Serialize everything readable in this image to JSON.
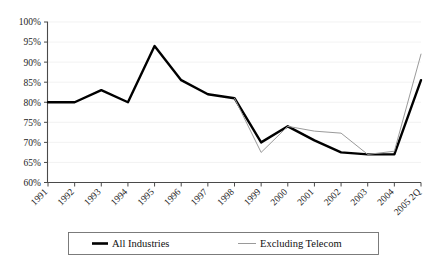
{
  "chart_data": {
    "type": "line",
    "title": "",
    "xlabel": "",
    "ylabel": "",
    "grid": true,
    "legend_position": "bottom",
    "categories": [
      "1991",
      "1992",
      "1993",
      "1994",
      "1995",
      "1996",
      "1997",
      "1998",
      "1999",
      "2000",
      "2001",
      "2002",
      "2003",
      "2004",
      "2005 2Q"
    ],
    "ylim": [
      60,
      100
    ],
    "ytick_labels": [
      "100%",
      "95%",
      "90%",
      "85%",
      "80%",
      "75%",
      "70%",
      "65%",
      "60%"
    ],
    "ytick_values": [
      100,
      95,
      90,
      85,
      80,
      75,
      70,
      65,
      60
    ],
    "series": [
      {
        "name": "All Industries",
        "color": "#000000",
        "width": 2.4,
        "values": [
          80.0,
          80.0,
          83.0,
          80.0,
          94.0,
          85.5,
          82.0,
          81.0,
          70.0,
          74.0,
          70.5,
          67.5,
          67.0,
          67.0,
          85.5
        ]
      },
      {
        "name": "Excluding Telecom",
        "color": "#9a9a9a",
        "width": 1.0,
        "values": [
          null,
          null,
          null,
          null,
          null,
          null,
          null,
          81.0,
          67.5,
          74.0,
          72.8,
          72.3,
          67.0,
          67.8,
          92.0
        ]
      }
    ]
  },
  "legend": {
    "items": [
      {
        "label": "All Industries",
        "color": "#000000",
        "thickness": 2.6
      },
      {
        "label": "Excluding Telecom",
        "color": "#9a9a9a",
        "thickness": 1.0
      }
    ]
  }
}
